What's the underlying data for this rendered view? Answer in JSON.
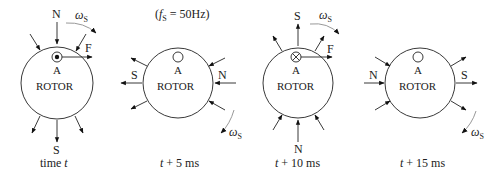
{
  "frequency_label": "(fS = 50Hz)",
  "frequency": {
    "symbol": "f",
    "subscript": "S",
    "value": "= 50Hz"
  },
  "omega": {
    "symbol": "ω",
    "subscript": "S"
  },
  "panels": [
    {
      "id": "t0",
      "caption_prefix": "time ",
      "caption_var": "t",
      "caption_suffix": "",
      "rotor_label": "ROTOR",
      "conductor_label": "A",
      "conductor_state": "dot",
      "pole_top": "N",
      "pole_bottom": "S",
      "force_label": "F",
      "field_direction": "down"
    },
    {
      "id": "t5",
      "caption_prefix": "",
      "caption_var": "t",
      "caption_suffix": " + 5 ms",
      "rotor_label": "ROTOR",
      "conductor_label": "A",
      "conductor_state": "empty",
      "pole_left": "S",
      "pole_right": "N",
      "field_direction": "left"
    },
    {
      "id": "t10",
      "caption_prefix": "",
      "caption_var": "t",
      "caption_suffix": " + 10 ms",
      "rotor_label": "ROTOR",
      "conductor_label": "A",
      "conductor_state": "cross",
      "pole_top": "S",
      "pole_bottom": "N",
      "force_label": "F",
      "field_direction": "up"
    },
    {
      "id": "t15",
      "caption_prefix": "",
      "caption_var": "t",
      "caption_suffix": " + 15 ms",
      "rotor_label": "ROTOR",
      "conductor_label": "A",
      "conductor_state": "empty",
      "pole_left": "N",
      "pole_right": "S",
      "field_direction": "right"
    }
  ]
}
